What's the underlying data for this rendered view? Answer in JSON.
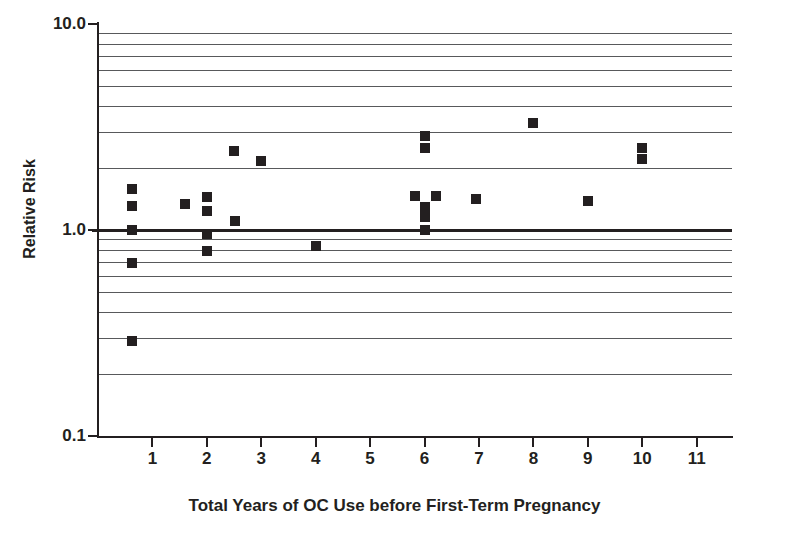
{
  "chart_data": {
    "type": "scatter",
    "title": "",
    "xlabel": "Total Years of OC Use before First-Term Pregnancy",
    "ylabel": "Relative Risk",
    "yscale": "log",
    "ylim": [
      0.1,
      10.0
    ],
    "xlim": [
      0.0,
      11.65
    ],
    "grid": true,
    "legend": null,
    "y_tick_labels": [
      "10.0",
      "1.0",
      "0.1"
    ],
    "y_tick_values": [
      10.0,
      1.0,
      0.1
    ],
    "y_gridlines": [
      9,
      8,
      7,
      6,
      5,
      4,
      3,
      2,
      0.9,
      0.8,
      0.7,
      0.6,
      0.5,
      0.4,
      0.3,
      0.2
    ],
    "x_tick_labels": [
      "1",
      "2",
      "3",
      "4",
      "5",
      "6",
      "7",
      "8",
      "9",
      "10",
      "11"
    ],
    "x_tick_values": [
      1,
      2,
      3,
      4,
      5,
      6,
      7,
      8,
      9,
      10,
      11
    ],
    "reference_line": {
      "y": 1.0,
      "style": "bold-solid"
    },
    "marker": {
      "shape": "square",
      "color": "#231f20",
      "size": 10
    },
    "points": [
      {
        "x": 0.62,
        "y": 1.58
      },
      {
        "x": 0.62,
        "y": 1.31
      },
      {
        "x": 0.62,
        "y": 1.0
      },
      {
        "x": 0.62,
        "y": 0.69
      },
      {
        "x": 0.62,
        "y": 0.29
      },
      {
        "x": 1.6,
        "y": 1.34
      },
      {
        "x": 2.0,
        "y": 1.45
      },
      {
        "x": 2.0,
        "y": 1.23
      },
      {
        "x": 2.0,
        "y": 0.96
      },
      {
        "x": 2.0,
        "y": 0.79
      },
      {
        "x": 2.5,
        "y": 2.43
      },
      {
        "x": 2.52,
        "y": 1.11
      },
      {
        "x": 3.0,
        "y": 2.16
      },
      {
        "x": 4.0,
        "y": 0.84
      },
      {
        "x": 5.82,
        "y": 1.47
      },
      {
        "x": 6.0,
        "y": 2.86
      },
      {
        "x": 6.0,
        "y": 2.5
      },
      {
        "x": 6.0,
        "y": 1.3
      },
      {
        "x": 6.0,
        "y": 1.16
      },
      {
        "x": 6.0,
        "y": 1.0
      },
      {
        "x": 6.22,
        "y": 1.47
      },
      {
        "x": 6.95,
        "y": 1.42
      },
      {
        "x": 8.0,
        "y": 3.3
      },
      {
        "x": 9.0,
        "y": 1.38
      },
      {
        "x": 10.0,
        "y": 2.5
      },
      {
        "x": 10.0,
        "y": 2.2
      }
    ]
  },
  "colors": {
    "marker": "#231f20",
    "axis": "#231f20",
    "grid": "#58595b",
    "background": "#ffffff"
  }
}
